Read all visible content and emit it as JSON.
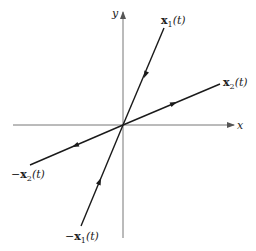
{
  "diagram": {
    "title": "",
    "colors": {
      "axis": "#777777",
      "trajectory": "#1a1a1a",
      "text": "#222222"
    },
    "axes": {
      "x_label": "x",
      "y_label": "y"
    },
    "trajectories": [
      {
        "id": "x1",
        "prefix": "",
        "var": "x",
        "sub": "1",
        "suffix": "(t)",
        "direction": "toward-origin"
      },
      {
        "id": "x2",
        "prefix": "",
        "var": "x",
        "sub": "2",
        "suffix": "(t)",
        "direction": "away-from-origin"
      },
      {
        "id": "neg-x2",
        "prefix": "−",
        "var": "x",
        "sub": "2",
        "suffix": "(t)",
        "direction": "away-from-origin"
      },
      {
        "id": "neg-x1",
        "prefix": "−",
        "var": "x",
        "sub": "1",
        "suffix": "(t)",
        "direction": "toward-origin"
      }
    ]
  }
}
